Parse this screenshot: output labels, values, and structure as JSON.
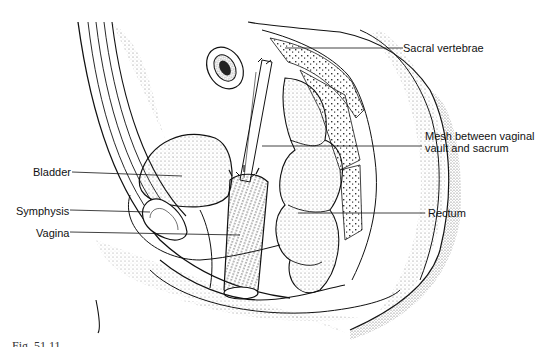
{
  "figure": {
    "caption_visible": "Fig. 51.11",
    "caption_truncated": true
  },
  "labels": {
    "sacral_vertebrae": "Sacral vertebrae",
    "mesh_line1": "Mesh between vaginal",
    "mesh_line2": "vault and sacrum",
    "bladder": "Bladder",
    "symphysis": "Symphysis",
    "vagina": "Vagina",
    "rectum": "Rectum"
  },
  "colors": {
    "ink": "#111111",
    "stipple": "#555555",
    "background": "#ffffff"
  }
}
